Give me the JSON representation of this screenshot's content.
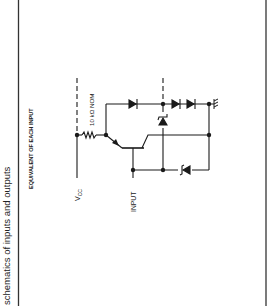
{
  "section_title": "schematics of inputs and outputs",
  "diagram": {
    "title": "EQUIVALENT OF EACH INPUT",
    "labels": {
      "vcc": "V",
      "vcc_sub": "CC",
      "resistor": "10 kΩ NOM",
      "input": "INPUT"
    },
    "components": [
      {
        "type": "resistor",
        "value": "10 kΩ NOM"
      },
      {
        "type": "npn-transistor"
      },
      {
        "type": "diode",
        "count": 3
      },
      {
        "type": "zener-diode",
        "count": 2
      },
      {
        "type": "ground"
      }
    ],
    "colors": {
      "ink": "#1a1a1a",
      "background": "#ffffff"
    }
  }
}
